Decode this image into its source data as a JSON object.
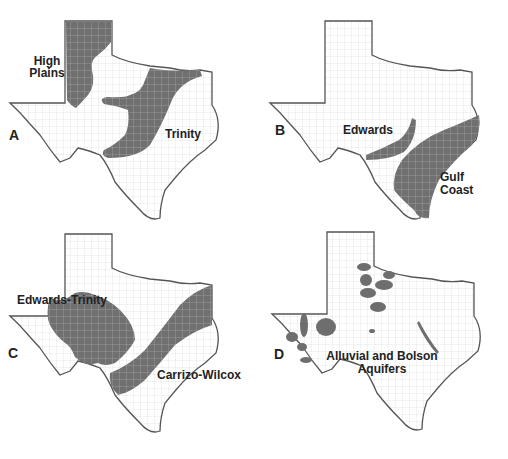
{
  "figure": {
    "panels": [
      {
        "letter": "A",
        "labels": [
          "High",
          "Plains",
          "Trinity"
        ]
      },
      {
        "letter": "B",
        "labels": [
          "Edwards",
          "Gulf",
          "Coast"
        ]
      },
      {
        "letter": "C",
        "labels": [
          "Edwards-Trinity",
          "Carrizo-Wilcox"
        ]
      },
      {
        "letter": "D",
        "labels": [
          "Alluvial and Bolson",
          "Aquifers"
        ]
      }
    ],
    "colors": {
      "aquifer": "#6e6e6e",
      "outline": "#555555",
      "county": "#d8d8d8",
      "background": "#ffffff"
    }
  }
}
